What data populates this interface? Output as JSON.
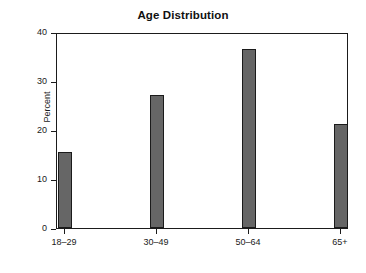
{
  "chart_data": {
    "type": "bar",
    "title": "Age Distribution",
    "subtitle": "",
    "xlabel": "",
    "ylabel": "Percent",
    "categories": [
      "18–29",
      "30–49",
      "50–64",
      "65+"
    ],
    "values": [
      15.5,
      27.1,
      36.5,
      21.2
    ],
    "ylim": [
      0,
      40
    ],
    "ytick_labels": [
      "0",
      "10",
      "20",
      "30",
      "40"
    ],
    "ytick_values": [
      0,
      10,
      20,
      30,
      40
    ],
    "grid": false,
    "legend": "none",
    "annotations": [],
    "style": {
      "bar_fill": "#666666",
      "bar_edge": "#1b1b1b",
      "frame_color": "#1b1b1b",
      "background": "#ffffff",
      "text_color": "#1a1a1a",
      "bar_width_px": 14
    }
  }
}
